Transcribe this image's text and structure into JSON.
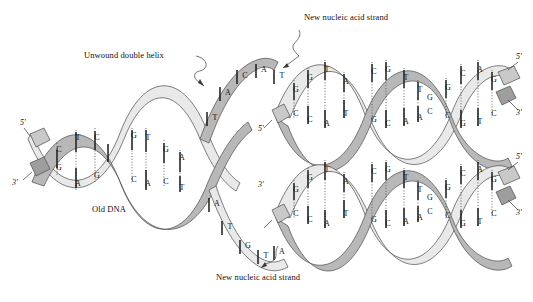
{
  "figure": {
    "background": "#ffffff",
    "ink": "#1a1a1a"
  },
  "colors": {
    "ribbon_front": "#b8b8b8",
    "ribbon_back": "#e4e4e4",
    "ribbon_stroke": "#4a4a4a",
    "base_bar": "#1a1a1a",
    "hbond": "#555555",
    "text": "#111111"
  },
  "labels": {
    "unwound_double_helix": "Unwound double helix",
    "old_dna": "Old DNA",
    "new_strand_top": "New nucleic acid strand",
    "new_strand_bottom": "New nucleic acid strand",
    "prime5": "5'",
    "prime3": "3'"
  },
  "ends": {
    "parent_left": {
      "top": "5'",
      "bottom": "3'"
    },
    "daughter_top_left": {
      "label": "5'"
    },
    "daughter_top_right": {
      "top": "5'",
      "bottom": "3'"
    },
    "daughter_bottom_left": {
      "label": "3'"
    },
    "daughter_bottom_right": {
      "top": "5'",
      "bottom": "3'"
    }
  },
  "old_dna": {
    "name": "Old DNA parental duplex",
    "turns": [
      {
        "pairs": [
          {
            "top": "C",
            "bottom": "G"
          },
          {
            "top": "T",
            "bottom": "A"
          },
          {
            "top": "C",
            "bottom": "G"
          }
        ]
      },
      {
        "pairs": [
          {
            "top": "G",
            "bottom": "C"
          },
          {
            "top": "T",
            "bottom": "A"
          },
          {
            "top": "G",
            "bottom": "C"
          },
          {
            "top": "A",
            "bottom": "T"
          }
        ]
      }
    ]
  },
  "fork": {
    "upper_template_bases": [
      "T",
      "A",
      "C",
      "A",
      "T"
    ],
    "lower_template_bases": [
      "A",
      "T",
      "G",
      "T",
      "A"
    ],
    "descr": "Replication fork where the parental helix unwinds into two template strands"
  },
  "daughter_top": {
    "name": "Upper daughter duplex",
    "turns": [
      {
        "pairs": [
          {
            "top": "G",
            "bottom": "C"
          },
          {
            "top": "G",
            "bottom": "C"
          },
          {
            "top": "T",
            "bottom": "A"
          },
          {
            "top": "A",
            "bottom": "T"
          }
        ]
      },
      {
        "pairs": [
          {
            "top": "C",
            "bottom": "G"
          },
          {
            "top": "G",
            "bottom": "C"
          },
          {
            "top": "T",
            "bottom": "A"
          },
          {
            "top": "T",
            "bottom": "A"
          },
          {
            "top": "G",
            "bottom": "C"
          }
        ]
      },
      {
        "pairs": [
          {
            "top": "G",
            "bottom": "C"
          },
          {
            "top": "C",
            "bottom": "G"
          },
          {
            "top": "A",
            "bottom": "T"
          },
          {
            "top": "G",
            "bottom": "C"
          }
        ]
      }
    ]
  },
  "daughter_bottom": {
    "name": "Lower daughter duplex",
    "turns": [
      {
        "pairs": [
          {
            "top": "G",
            "bottom": "C"
          },
          {
            "top": "G",
            "bottom": "C"
          },
          {
            "top": "T",
            "bottom": "A"
          },
          {
            "top": "A",
            "bottom": "T"
          }
        ]
      },
      {
        "pairs": [
          {
            "top": "C",
            "bottom": "G"
          },
          {
            "top": "G",
            "bottom": "C"
          },
          {
            "top": "T",
            "bottom": "A"
          },
          {
            "top": "T",
            "bottom": "A"
          },
          {
            "top": "G",
            "bottom": "C"
          }
        ]
      },
      {
        "pairs": [
          {
            "top": "G",
            "bottom": "C"
          },
          {
            "top": "C",
            "bottom": "G"
          },
          {
            "top": "A",
            "bottom": "T"
          },
          {
            "top": "G",
            "bottom": "C"
          }
        ]
      }
    ]
  }
}
